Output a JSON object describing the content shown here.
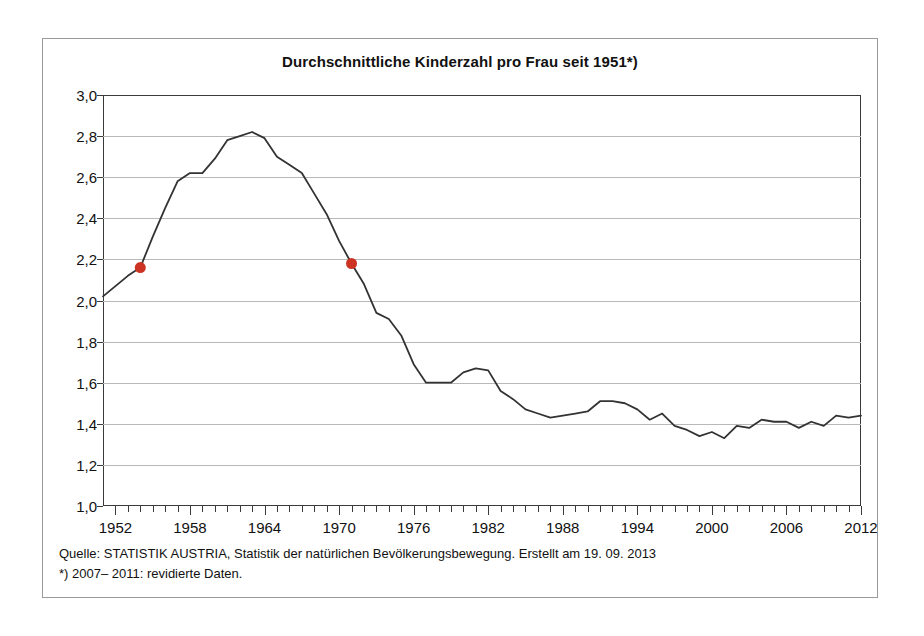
{
  "chart_data": {
    "type": "line",
    "title": "Durchschnittliche Kinderzahl pro Frau seit 1951*)",
    "xlabel": "",
    "ylabel": "",
    "xlim": [
      1951,
      2012
    ],
    "ylim": [
      1.0,
      3.0
    ],
    "grid": true,
    "legend": "none",
    "y_ticks": [
      "3,0",
      "2,8",
      "2,6",
      "2,4",
      "2,2",
      "2,0",
      "1,8",
      "1,6",
      "1,4",
      "1,2",
      "1,0"
    ],
    "y_tick_values": [
      3.0,
      2.8,
      2.6,
      2.4,
      2.2,
      2.0,
      1.8,
      1.6,
      1.4,
      1.2,
      1.0
    ],
    "x_ticks": [
      "1952",
      "1958",
      "1964",
      "1970",
      "1976",
      "1982",
      "1988",
      "1994",
      "2000",
      "2006",
      "2012"
    ],
    "x_tick_values": [
      1952,
      1958,
      1964,
      1970,
      1976,
      1982,
      1988,
      1994,
      2000,
      2006,
      2012
    ],
    "x_minor_tick_step": 1,
    "line_color": "#333333",
    "marker_color": "#cc3322",
    "grid_color": "#b9b9b9",
    "x": [
      1951,
      1952,
      1953,
      1954,
      1955,
      1956,
      1957,
      1958,
      1959,
      1960,
      1961,
      1962,
      1963,
      1964,
      1965,
      1966,
      1967,
      1968,
      1969,
      1970,
      1971,
      1972,
      1973,
      1974,
      1975,
      1976,
      1977,
      1978,
      1979,
      1980,
      1981,
      1982,
      1983,
      1984,
      1985,
      1986,
      1987,
      1988,
      1989,
      1990,
      1991,
      1992,
      1993,
      1994,
      1995,
      1996,
      1997,
      1998,
      1999,
      2000,
      2001,
      2002,
      2003,
      2004,
      2005,
      2006,
      2007,
      2008,
      2009,
      2010,
      2011,
      2012
    ],
    "values": [
      2.02,
      2.07,
      2.12,
      2.16,
      2.31,
      2.45,
      2.58,
      2.62,
      2.62,
      2.69,
      2.78,
      2.8,
      2.82,
      2.79,
      2.7,
      2.66,
      2.62,
      2.52,
      2.42,
      2.29,
      2.18,
      2.08,
      1.94,
      1.91,
      1.83,
      1.69,
      1.6,
      1.6,
      1.6,
      1.65,
      1.67,
      1.66,
      1.56,
      1.52,
      1.47,
      1.45,
      1.43,
      1.44,
      1.45,
      1.46,
      1.51,
      1.51,
      1.5,
      1.47,
      1.42,
      1.45,
      1.39,
      1.37,
      1.34,
      1.36,
      1.33,
      1.39,
      1.38,
      1.42,
      1.41,
      1.41,
      1.38,
      1.41,
      1.39,
      1.44,
      1.43,
      1.44
    ],
    "markers": [
      {
        "x": 1954,
        "y": 2.16,
        "label": "1954",
        "color": "#cc3322"
      },
      {
        "x": 1971,
        "y": 2.18,
        "label": "1971",
        "color": "#cc3322"
      }
    ]
  },
  "footer": {
    "source_line": "Quelle: STATISTIK AUSTRIA, Statistik der natürlichen Bevölkerungsbewegung. Erstellt am 19. 09. 2013",
    "footnote_line": "*) 2007– 2011: revidierte Daten."
  }
}
